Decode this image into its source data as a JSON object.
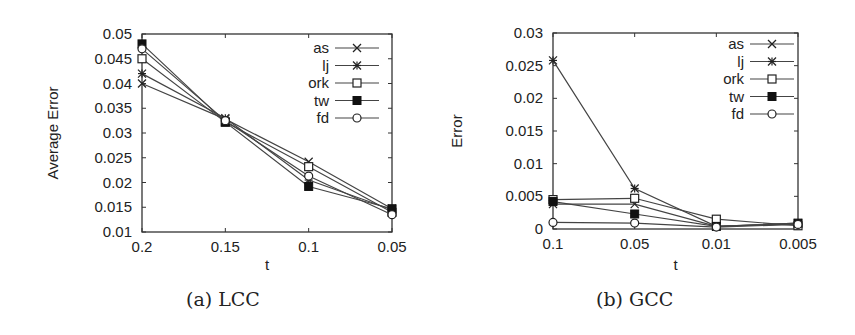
{
  "chart_data": [
    {
      "type": "line",
      "caption": "(a) LCC",
      "title": "",
      "xlabel": "t",
      "ylabel": "Average Error",
      "categories": [
        "0.2",
        "0.15",
        "0.1",
        "0.05"
      ],
      "ylim": [
        0.01,
        0.05
      ],
      "yticks": [
        "0.05",
        "0.045",
        "0.04",
        "0.035",
        "0.03",
        "0.025",
        "0.02",
        "0.015",
        "0.01"
      ],
      "grid": false,
      "legend_position": "top-right",
      "series": [
        {
          "name": "as",
          "marker": "x",
          "values": [
            0.04,
            0.0328,
            0.0242,
            0.0147
          ]
        },
        {
          "name": "lj",
          "marker": "star",
          "values": [
            0.042,
            0.033,
            0.0205,
            0.0145
          ]
        },
        {
          "name": "ork",
          "marker": "square",
          "values": [
            0.045,
            0.0322,
            0.0232,
            0.014
          ]
        },
        {
          "name": "tw",
          "marker": "filled-square",
          "values": [
            0.048,
            0.0322,
            0.0192,
            0.0147
          ]
        },
        {
          "name": "fd",
          "marker": "circle",
          "values": [
            0.047,
            0.0325,
            0.0213,
            0.0135
          ]
        }
      ]
    },
    {
      "type": "line",
      "caption": "(b) GCC",
      "title": "",
      "xlabel": "t",
      "ylabel": "Error",
      "categories": [
        "0.1",
        "0.05",
        "0.01",
        "0.005"
      ],
      "ylim": [
        0,
        0.03
      ],
      "yticks": [
        "0.03",
        "0.025",
        "0.02",
        "0.015",
        "0.01",
        "0.005",
        "0"
      ],
      "grid": false,
      "legend_position": "top-right",
      "series": [
        {
          "name": "as",
          "marker": "x",
          "values": [
            0.0038,
            0.0038,
            0.0004,
            0.0008
          ]
        },
        {
          "name": "lj",
          "marker": "star",
          "values": [
            0.0258,
            0.0062,
            0.0004,
            0.0009
          ]
        },
        {
          "name": "ork",
          "marker": "square",
          "values": [
            0.0045,
            0.0047,
            0.0015,
            0.0005
          ]
        },
        {
          "name": "tw",
          "marker": "filled-square",
          "values": [
            0.0042,
            0.0023,
            0.0004,
            0.0009
          ]
        },
        {
          "name": "fd",
          "marker": "circle",
          "values": [
            0.001,
            0.0009,
            0.0003,
            0.0007
          ]
        }
      ]
    }
  ]
}
